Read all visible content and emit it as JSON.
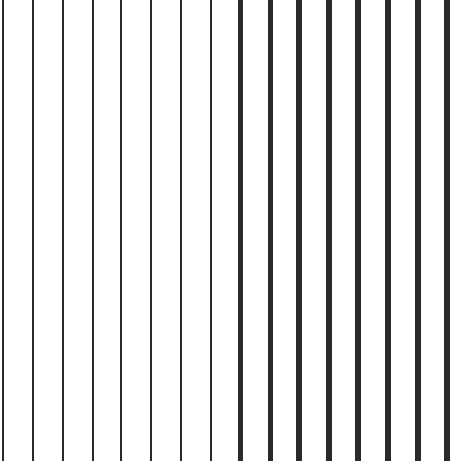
{
  "pattern": {
    "type": "vertical-line-grating",
    "background": "#ffffff",
    "line_color": "#2a2a2a",
    "lines": [
      {
        "x": 3,
        "width": 2
      },
      {
        "x": 33,
        "width": 2
      },
      {
        "x": 63,
        "width": 2
      },
      {
        "x": 93,
        "width": 2
      },
      {
        "x": 121,
        "width": 2
      },
      {
        "x": 151,
        "width": 2
      },
      {
        "x": 181,
        "width": 2
      },
      {
        "x": 211,
        "width": 2
      },
      {
        "x": 240,
        "width": 5
      },
      {
        "x": 270,
        "width": 5
      },
      {
        "x": 299,
        "width": 6
      },
      {
        "x": 329,
        "width": 6
      },
      {
        "x": 358,
        "width": 6
      },
      {
        "x": 388,
        "width": 6
      },
      {
        "x": 418,
        "width": 6
      },
      {
        "x": 447,
        "width": 6
      }
    ]
  }
}
